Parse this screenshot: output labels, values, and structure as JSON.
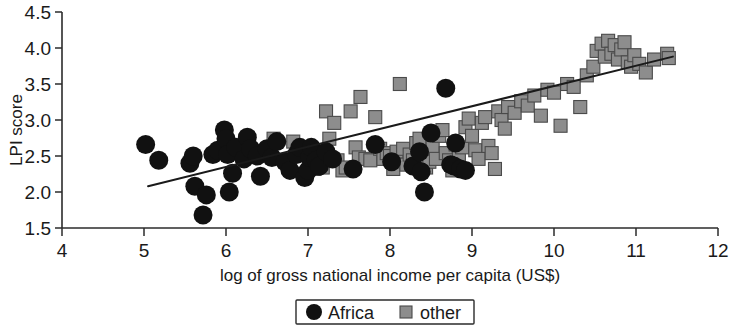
{
  "chart_data": {
    "type": "scatter",
    "title": "",
    "xlabel": "log of gross national income per capita (US$)",
    "ylabel": "LPI score",
    "xlim": [
      4,
      12
    ],
    "ylim": [
      1.5,
      4.5
    ],
    "xticks": [
      "4",
      "5",
      "6",
      "7",
      "8",
      "9",
      "10",
      "11",
      "12"
    ],
    "yticks": [
      "1.5",
      "2.0",
      "2.5",
      "3.0",
      "3.5",
      "4.0",
      "4.5"
    ],
    "grid": false,
    "legend_position": "bottom-center",
    "colors": {
      "africa_marker": "#111111",
      "other_marker": "#8d8d8d",
      "other_marker_edge": "#4a4a4a",
      "axis": "#2b2b2b",
      "trend_line": "#1a1a1a",
      "background": "#ffffff"
    },
    "legend": [
      {
        "label": "Africa",
        "marker": "circle",
        "color": "#111111"
      },
      {
        "label": "other",
        "marker": "square",
        "color": "#8d8d8d"
      }
    ],
    "trend_line": {
      "x": [
        5.05,
        11.45
      ],
      "y": [
        2.08,
        3.88
      ]
    },
    "series": [
      {
        "name": "Africa",
        "marker": "circle",
        "points": [
          [
            5.02,
            2.66
          ],
          [
            5.18,
            2.44
          ],
          [
            5.56,
            2.4
          ],
          [
            5.6,
            2.5
          ],
          [
            5.62,
            2.08
          ],
          [
            5.72,
            1.68
          ],
          [
            5.76,
            1.96
          ],
          [
            5.84,
            2.52
          ],
          [
            5.9,
            2.58
          ],
          [
            5.98,
            2.86
          ],
          [
            6.0,
            2.74
          ],
          [
            6.02,
            2.52
          ],
          [
            6.04,
            2.0
          ],
          [
            6.08,
            2.26
          ],
          [
            6.12,
            2.62
          ],
          [
            6.22,
            2.46
          ],
          [
            6.26,
            2.76
          ],
          [
            6.3,
            2.6
          ],
          [
            6.38,
            2.5
          ],
          [
            6.42,
            2.22
          ],
          [
            6.5,
            2.6
          ],
          [
            6.56,
            2.48
          ],
          [
            6.62,
            2.7
          ],
          [
            6.72,
            2.42
          ],
          [
            6.78,
            2.3
          ],
          [
            6.86,
            2.52
          ],
          [
            6.9,
            2.62
          ],
          [
            6.96,
            2.2
          ],
          [
            7.0,
            2.3
          ],
          [
            7.02,
            2.48
          ],
          [
            7.04,
            2.62
          ],
          [
            7.1,
            2.44
          ],
          [
            7.14,
            2.36
          ],
          [
            7.22,
            2.56
          ],
          [
            7.3,
            2.46
          ],
          [
            7.55,
            2.32
          ],
          [
            7.82,
            2.66
          ],
          [
            8.02,
            2.42
          ],
          [
            8.28,
            2.36
          ],
          [
            8.36,
            2.56
          ],
          [
            8.38,
            2.28
          ],
          [
            8.42,
            2.0
          ],
          [
            8.5,
            2.82
          ],
          [
            8.68,
            3.44
          ],
          [
            8.74,
            2.38
          ],
          [
            8.78,
            2.36
          ],
          [
            8.8,
            2.68
          ],
          [
            8.86,
            2.32
          ],
          [
            8.92,
            2.3
          ]
        ]
      },
      {
        "name": "other",
        "marker": "square",
        "points": [
          [
            6.58,
            2.74
          ],
          [
            6.82,
            2.7
          ],
          [
            7.02,
            2.56
          ],
          [
            7.08,
            2.32
          ],
          [
            7.18,
            2.34
          ],
          [
            7.22,
            3.12
          ],
          [
            7.26,
            2.74
          ],
          [
            7.32,
            2.96
          ],
          [
            7.36,
            2.44
          ],
          [
            7.42,
            2.3
          ],
          [
            7.46,
            2.34
          ],
          [
            7.52,
            3.12
          ],
          [
            7.58,
            2.62
          ],
          [
            7.62,
            2.48
          ],
          [
            7.64,
            3.32
          ],
          [
            7.7,
            2.46
          ],
          [
            7.76,
            2.44
          ],
          [
            7.82,
            3.04
          ],
          [
            7.88,
            2.6
          ],
          [
            7.92,
            2.46
          ],
          [
            7.96,
            2.54
          ],
          [
            8.0,
            2.5
          ],
          [
            8.04,
            2.32
          ],
          [
            8.08,
            2.56
          ],
          [
            8.12,
            3.5
          ],
          [
            8.16,
            2.6
          ],
          [
            8.2,
            2.38
          ],
          [
            8.24,
            2.52
          ],
          [
            8.28,
            2.44
          ],
          [
            8.32,
            2.68
          ],
          [
            8.36,
            2.74
          ],
          [
            8.4,
            2.56
          ],
          [
            8.44,
            2.34
          ],
          [
            8.48,
            2.42
          ],
          [
            8.52,
            2.62
          ],
          [
            8.56,
            2.46
          ],
          [
            8.6,
            2.78
          ],
          [
            8.64,
            2.86
          ],
          [
            8.68,
            2.54
          ],
          [
            8.72,
            2.44
          ],
          [
            8.76,
            2.3
          ],
          [
            8.8,
            2.66
          ],
          [
            8.84,
            2.5
          ],
          [
            8.88,
            2.62
          ],
          [
            8.92,
            2.9
          ],
          [
            8.96,
            3.02
          ],
          [
            9.0,
            2.78
          ],
          [
            9.04,
            2.58
          ],
          [
            9.08,
            2.46
          ],
          [
            9.12,
            2.96
          ],
          [
            9.16,
            3.04
          ],
          [
            9.2,
            2.64
          ],
          [
            9.24,
            2.54
          ],
          [
            9.28,
            2.32
          ],
          [
            9.32,
            3.12
          ],
          [
            9.36,
            3.0
          ],
          [
            9.4,
            2.88
          ],
          [
            9.44,
            3.18
          ],
          [
            9.52,
            3.1
          ],
          [
            9.6,
            3.26
          ],
          [
            9.68,
            3.2
          ],
          [
            9.76,
            3.34
          ],
          [
            9.84,
            3.06
          ],
          [
            9.92,
            3.42
          ],
          [
            10.0,
            3.38
          ],
          [
            10.08,
            2.92
          ],
          [
            10.16,
            3.5
          ],
          [
            10.24,
            3.46
          ],
          [
            10.32,
            3.18
          ],
          [
            10.4,
            3.62
          ],
          [
            10.48,
            3.74
          ],
          [
            10.52,
            3.96
          ],
          [
            10.58,
            4.06
          ],
          [
            10.62,
            3.88
          ],
          [
            10.66,
            4.1
          ],
          [
            10.7,
            3.92
          ],
          [
            10.74,
            4.04
          ],
          [
            10.78,
            3.84
          ],
          [
            10.82,
            3.98
          ],
          [
            10.86,
            4.08
          ],
          [
            10.9,
            3.8
          ],
          [
            10.94,
            3.74
          ],
          [
            10.98,
            3.9
          ],
          [
            11.04,
            3.78
          ],
          [
            11.12,
            3.66
          ],
          [
            11.22,
            3.84
          ],
          [
            11.38,
            3.92
          ],
          [
            11.4,
            3.86
          ]
        ]
      }
    ]
  }
}
